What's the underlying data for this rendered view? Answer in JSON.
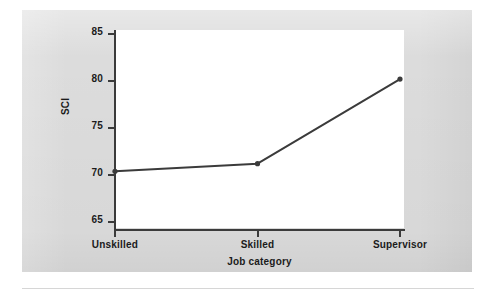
{
  "figure": {
    "background_color": "#dcdcdc",
    "plot_background_color": "#ffffff",
    "axis_color": "#3b3b3b",
    "text_color": "#1b1b1b",
    "rule_color": "#d6d6d6"
  },
  "chart_data": {
    "type": "line",
    "title": "",
    "subtitle": "",
    "xlabel": "Job category",
    "ylabel": "SCI",
    "categories": [
      "Unskilled",
      "Skilled",
      "Supervisor"
    ],
    "values": [
      70.4,
      71.2,
      80.2
    ],
    "series": [
      {
        "name": "SCI",
        "values": [
          70.4,
          71.2,
          80.2
        ],
        "color": "#3b3b3b",
        "marker": "circle",
        "line_width": 2
      }
    ],
    "ylim": [
      65,
      85
    ],
    "yticks": [
      65,
      70,
      75,
      80,
      85
    ],
    "ytick_labels": [
      "65",
      "70",
      "75",
      "80",
      "85"
    ],
    "xticks": [
      "Unskilled",
      "Skilled",
      "Supervisor"
    ],
    "grid": false,
    "legend": false,
    "legend_position": "none"
  }
}
